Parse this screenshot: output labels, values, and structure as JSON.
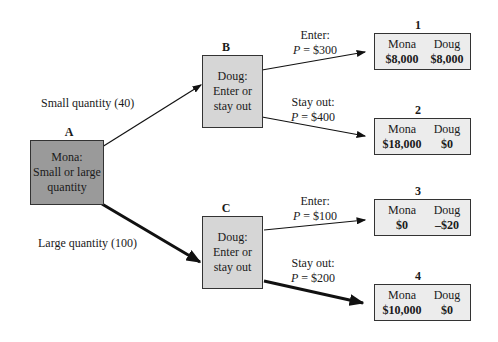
{
  "nodes": {
    "A": {
      "label": "A",
      "lines": [
        "Mona:",
        "Small or large",
        "quantity"
      ]
    },
    "B": {
      "label": "B",
      "lines": [
        "Doug:",
        "Enter or",
        "stay out"
      ]
    },
    "C": {
      "label": "C",
      "lines": [
        "Doug:",
        "Enter or",
        "stay out"
      ]
    }
  },
  "edges": {
    "small": "Small quantity (40)",
    "large": "Large quantity (100)",
    "b_enter": {
      "action": "Enter:",
      "price_var": "P",
      "price": " = $300"
    },
    "b_stay": {
      "action": "Stay out:",
      "price_var": "P",
      "price": " = $400"
    },
    "c_enter": {
      "action": "Enter:",
      "price_var": "P",
      "price": " = $100"
    },
    "c_stay": {
      "action": "Stay out:",
      "price_var": "P",
      "price": " = $200"
    }
  },
  "outcomes": [
    {
      "num": "1",
      "p1": "Mona",
      "v1": "$8,000",
      "p2": "Doug",
      "v2": "$8,000"
    },
    {
      "num": "2",
      "p1": "Mona",
      "v1": "$18,000",
      "p2": "Doug",
      "v2": "$0"
    },
    {
      "num": "3",
      "p1": "Mona",
      "v1": "$0",
      "p2": "Doug",
      "v2": "–$20"
    },
    {
      "num": "4",
      "p1": "Mona",
      "v1": "$10,000",
      "p2": "Doug",
      "v2": "$0"
    }
  ],
  "colors": {
    "node_a": "#9a9a9a",
    "node_bc": "#d6d6d6",
    "outcome": "#ececec"
  }
}
